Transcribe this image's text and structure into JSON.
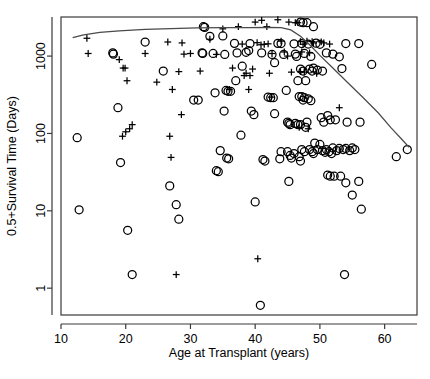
{
  "chart_data": {
    "type": "scatter",
    "title": "",
    "xlabel": "Age at Transplant (years)",
    "ylabel": "0.5+Survival Time (Days)",
    "xlim": [
      10.0,
      65.0
    ],
    "ylim": [
      0.45,
      3200
    ],
    "yscale": "log",
    "xscale": "linear",
    "grid": false,
    "legend": "none",
    "xticks": [
      10,
      20,
      30,
      40,
      50,
      60
    ],
    "xtick_labels": [
      "10",
      "20",
      "30",
      "40",
      "50",
      "60"
    ],
    "yticks": [
      1,
      10,
      100,
      1000
    ],
    "ytick_labels": [
      "1",
      "10",
      "100",
      "1000"
    ],
    "series": [
      {
        "name": "censored",
        "marker": "plus",
        "points": [
          [
            14.0,
            1700
          ],
          [
            14.2,
            1080
          ],
          [
            19.0,
            900
          ],
          [
            19.6,
            700
          ],
          [
            19.9,
            700
          ],
          [
            20.2,
            480
          ],
          [
            20.6,
            115
          ],
          [
            20.0,
            105
          ],
          [
            21.0,
            130
          ],
          [
            19.5,
            92
          ],
          [
            23.0,
            1080
          ],
          [
            24.8,
            460
          ],
          [
            26.5,
            1520
          ],
          [
            27.2,
            370
          ],
          [
            26.8,
            92
          ],
          [
            27.0,
            49
          ],
          [
            28.7,
            1480
          ],
          [
            29.0,
            1060
          ],
          [
            28.6,
            175
          ],
          [
            28.2,
            630
          ],
          [
            31.5,
            640
          ],
          [
            27.8,
            1.5
          ],
          [
            34.0,
            1050
          ],
          [
            37.4,
            2400
          ],
          [
            38.0,
            1430
          ],
          [
            36.5,
            700
          ],
          [
            38.3,
            560
          ],
          [
            38.6,
            600
          ],
          [
            39.2,
            560
          ],
          [
            39.6,
            680
          ],
          [
            39.0,
            370
          ],
          [
            40.0,
            2750
          ],
          [
            40.3,
            1490
          ],
          [
            40.9,
            1400
          ],
          [
            41.0,
            2900
          ],
          [
            41.4,
            1420
          ],
          [
            41.8,
            2400
          ],
          [
            42.0,
            1440
          ],
          [
            42.6,
            1080
          ],
          [
            42.2,
            600
          ],
          [
            42.5,
            295
          ],
          [
            43.5,
            2950
          ],
          [
            44.0,
            1560
          ],
          [
            44.5,
            1130
          ],
          [
            45.2,
            2750
          ],
          [
            45.6,
            620
          ],
          [
            45.0,
            1000
          ],
          [
            46.2,
            2700
          ],
          [
            46.6,
            2700
          ],
          [
            47.0,
            1540
          ],
          [
            47.4,
            1420
          ],
          [
            47.0,
            630
          ],
          [
            47.6,
            620
          ],
          [
            47.2,
            1130
          ],
          [
            48.0,
            1560
          ],
          [
            48.4,
            1100
          ],
          [
            48.8,
            1540
          ],
          [
            49.0,
            1480
          ],
          [
            49.5,
            600
          ],
          [
            50.2,
            1530
          ],
          [
            50.6,
            1480
          ],
          [
            51.5,
            1430
          ],
          [
            46.8,
            120
          ],
          [
            48.2,
            115
          ],
          [
            53.0,
            215
          ],
          [
            40.4,
            2.4
          ],
          [
            36.0,
            370
          ],
          [
            35.0,
            2250
          ],
          [
            33.0,
            1650
          ],
          [
            30.0,
            1080
          ]
        ]
      },
      {
        "name": "deceased",
        "marker": "circle",
        "points": [
          [
            12.5,
            88
          ],
          [
            12.8,
            10.3
          ],
          [
            18.0,
            1100
          ],
          [
            18.1,
            1060
          ],
          [
            18.8,
            215
          ],
          [
            19.2,
            42
          ],
          [
            20.3,
            5.6
          ],
          [
            21.0,
            1.5
          ],
          [
            23.0,
            1520
          ],
          [
            25.8,
            640
          ],
          [
            26.8,
            21
          ],
          [
            27.8,
            12
          ],
          [
            28.2,
            7.8
          ],
          [
            31.2,
            270
          ],
          [
            32.0,
            2400
          ],
          [
            32.2,
            2350
          ],
          [
            31.8,
            1100
          ],
          [
            31.9,
            1080
          ],
          [
            33.0,
            1800
          ],
          [
            33.8,
            335
          ],
          [
            34.0,
            33
          ],
          [
            34.3,
            32
          ],
          [
            35.0,
            1820
          ],
          [
            35.3,
            1050
          ],
          [
            35.5,
            360
          ],
          [
            35.8,
            350
          ],
          [
            35.2,
            195
          ],
          [
            34.6,
            60
          ],
          [
            35.6,
            48
          ],
          [
            35.9,
            47
          ],
          [
            36.8,
            1460
          ],
          [
            37.2,
            1100
          ],
          [
            38.0,
            740
          ],
          [
            37.8,
            95
          ],
          [
            39.0,
            1180
          ],
          [
            39.4,
            195
          ],
          [
            39.8,
            175
          ],
          [
            40.0,
            13
          ],
          [
            40.8,
            0.6
          ],
          [
            41.0,
            1100
          ],
          [
            41.2,
            46
          ],
          [
            41.5,
            44
          ],
          [
            42.0,
            295
          ],
          [
            42.4,
            290
          ],
          [
            42.8,
            290
          ],
          [
            43.0,
            820
          ],
          [
            43.5,
            1460
          ],
          [
            44.0,
            1450
          ],
          [
            44.4,
            1050
          ],
          [
            44.8,
            360
          ],
          [
            45.0,
            140
          ],
          [
            45.2,
            135
          ],
          [
            45.4,
            130
          ],
          [
            45.0,
            58
          ],
          [
            45.4,
            52
          ],
          [
            45.6,
            48
          ],
          [
            45.2,
            24
          ],
          [
            46.0,
            1440
          ],
          [
            46.2,
            1060
          ],
          [
            46.4,
            990
          ],
          [
            46.6,
            480
          ],
          [
            46.8,
            300
          ],
          [
            46.2,
            135
          ],
          [
            46.6,
            130
          ],
          [
            46.0,
            55
          ],
          [
            46.8,
            50
          ],
          [
            47.0,
            2750
          ],
          [
            47.4,
            2700
          ],
          [
            47.2,
            1450
          ],
          [
            47.6,
            1080
          ],
          [
            47.0,
            680
          ],
          [
            47.4,
            640
          ],
          [
            47.8,
            480
          ],
          [
            47.2,
            300
          ],
          [
            47.6,
            290
          ],
          [
            47.4,
            270
          ],
          [
            47.0,
            130
          ],
          [
            47.8,
            120
          ],
          [
            47.2,
            62
          ],
          [
            47.6,
            58
          ],
          [
            47.0,
            44
          ],
          [
            48.0,
            2700
          ],
          [
            48.2,
            1430
          ],
          [
            48.6,
            990
          ],
          [
            48.4,
            680
          ],
          [
            48.8,
            640
          ],
          [
            48.2,
            280
          ],
          [
            48.6,
            265
          ],
          [
            48.0,
            140
          ],
          [
            48.4,
            62
          ],
          [
            48.8,
            58
          ],
          [
            49.0,
            2400
          ],
          [
            49.4,
            1470
          ],
          [
            49.0,
            700
          ],
          [
            49.6,
            660
          ],
          [
            49.2,
            75
          ],
          [
            49.6,
            62
          ],
          [
            49.0,
            55
          ],
          [
            50.0,
            1420
          ],
          [
            50.4,
            640
          ],
          [
            50.2,
            160
          ],
          [
            50.6,
            140
          ],
          [
            50.0,
            72
          ],
          [
            50.4,
            60
          ],
          [
            50.8,
            57
          ],
          [
            51.0,
            1100
          ],
          [
            51.2,
            170
          ],
          [
            51.6,
            150
          ],
          [
            51.0,
            62
          ],
          [
            51.4,
            58
          ],
          [
            51.8,
            55
          ],
          [
            51.2,
            29
          ],
          [
            51.6,
            28
          ],
          [
            52.0,
            1060
          ],
          [
            52.4,
            150
          ],
          [
            52.0,
            65
          ],
          [
            52.6,
            60
          ],
          [
            52.2,
            28
          ],
          [
            53.0,
            980
          ],
          [
            53.4,
            690
          ],
          [
            53.0,
            64
          ],
          [
            53.6,
            62
          ],
          [
            53.2,
            28
          ],
          [
            54.0,
            1450
          ],
          [
            54.2,
            140
          ],
          [
            54.0,
            64
          ],
          [
            54.6,
            60
          ],
          [
            54.0,
            23
          ],
          [
            53.8,
            1.5
          ],
          [
            55.0,
            65
          ],
          [
            55.4,
            62
          ],
          [
            55.0,
            16
          ],
          [
            56.0,
            1450
          ],
          [
            56.2,
            140
          ],
          [
            56.0,
            24
          ],
          [
            56.4,
            10.5
          ],
          [
            58.0,
            780
          ],
          [
            61.8,
            50
          ],
          [
            63.5,
            62
          ],
          [
            42.6,
            1050
          ],
          [
            43.0,
            180
          ],
          [
            44.0,
            58
          ],
          [
            43.8,
            47
          ],
          [
            39.2,
            1450
          ],
          [
            38.6,
            1120
          ],
          [
            37.0,
            480
          ],
          [
            36.2,
            350
          ],
          [
            33.5,
            1080
          ],
          [
            30.5,
            270
          ]
        ]
      }
    ],
    "smoother": {
      "name": "lowess",
      "points": [
        [
          11.8,
          1730
        ],
        [
          13.5,
          1880
        ],
        [
          16.0,
          2020
        ],
        [
          19.0,
          2120
        ],
        [
          23.0,
          2210
        ],
        [
          27.0,
          2270
        ],
        [
          31.0,
          2310
        ],
        [
          35.0,
          2330
        ],
        [
          39.0,
          2340
        ],
        [
          42.0,
          2350
        ],
        [
          44.0,
          2330
        ],
        [
          45.5,
          2180
        ],
        [
          47.0,
          1800
        ],
        [
          48.5,
          1380
        ],
        [
          50.0,
          1020
        ],
        [
          52.0,
          700
        ],
        [
          54.0,
          480
        ],
        [
          56.5,
          300
        ],
        [
          59.0,
          185
        ],
        [
          61.0,
          118
        ],
        [
          63.0,
          78
        ],
        [
          63.8,
          66
        ]
      ]
    }
  },
  "axes": {
    "x_title": "Age at Transplant (years)",
    "y_title": "0.5+Survival Time (Days)"
  }
}
